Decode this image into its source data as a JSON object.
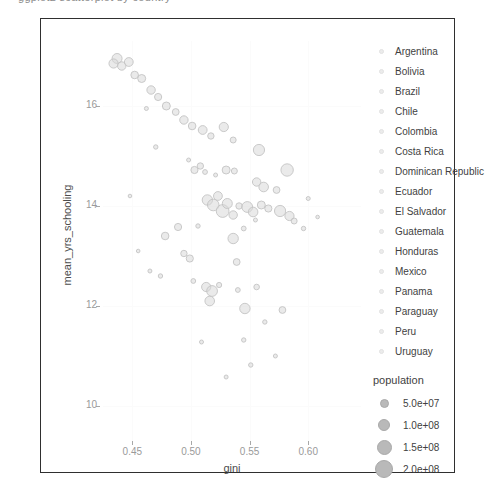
{
  "top_fragment": "ggplot2 scatterplot by country",
  "chart_data": {
    "type": "scatter",
    "title": "",
    "xlabel": "gini",
    "ylabel": "mean_yrs_schooling",
    "xlim": [
      0.425,
      0.645
    ],
    "ylim": [
      9.3,
      17.3
    ],
    "xticks": [
      "0.45",
      "0.50",
      "0.55",
      "0.60"
    ],
    "xtick_values": [
      0.45,
      0.5,
      0.55,
      0.6
    ],
    "yticks": [
      "10",
      "12",
      "14",
      "16"
    ],
    "ytick_values": [
      10,
      12,
      14,
      16
    ],
    "grid": true,
    "legend_position": "right",
    "size_encoding": "population",
    "color_encoding": "country",
    "point_color": "#d8d8d8",
    "point_stroke": "#c4c4c4",
    "points": [
      {
        "x": 0.437,
        "y": 16.95,
        "r": 5.0
      },
      {
        "x": 0.434,
        "y": 16.85,
        "r": 4.6
      },
      {
        "x": 0.441,
        "y": 16.8,
        "r": 4.2
      },
      {
        "x": 0.447,
        "y": 16.88,
        "r": 4.4
      },
      {
        "x": 0.452,
        "y": 16.62,
        "r": 3.8
      },
      {
        "x": 0.458,
        "y": 16.55,
        "r": 4.0
      },
      {
        "x": 0.466,
        "y": 16.32,
        "r": 4.2
      },
      {
        "x": 0.472,
        "y": 16.18,
        "r": 3.6
      },
      {
        "x": 0.479,
        "y": 16.0,
        "r": 4.0
      },
      {
        "x": 0.487,
        "y": 15.88,
        "r": 3.4
      },
      {
        "x": 0.494,
        "y": 15.72,
        "r": 4.2
      },
      {
        "x": 0.501,
        "y": 15.6,
        "r": 3.8
      },
      {
        "x": 0.51,
        "y": 15.52,
        "r": 4.4
      },
      {
        "x": 0.517,
        "y": 15.4,
        "r": 3.2
      },
      {
        "x": 0.528,
        "y": 15.58,
        "r": 4.6
      },
      {
        "x": 0.536,
        "y": 15.32,
        "r": 3.0
      },
      {
        "x": 0.462,
        "y": 15.95,
        "r": 2.0
      },
      {
        "x": 0.47,
        "y": 15.18,
        "r": 2.2
      },
      {
        "x": 0.498,
        "y": 14.92,
        "r": 2.0
      },
      {
        "x": 0.503,
        "y": 14.72,
        "r": 3.6
      },
      {
        "x": 0.508,
        "y": 14.8,
        "r": 3.2
      },
      {
        "x": 0.512,
        "y": 14.68,
        "r": 2.4
      },
      {
        "x": 0.521,
        "y": 14.62,
        "r": 2.0
      },
      {
        "x": 0.53,
        "y": 14.72,
        "r": 4.0
      },
      {
        "x": 0.537,
        "y": 14.7,
        "r": 3.0
      },
      {
        "x": 0.558,
        "y": 15.12,
        "r": 5.6
      },
      {
        "x": 0.556,
        "y": 14.48,
        "r": 4.2
      },
      {
        "x": 0.562,
        "y": 14.38,
        "r": 4.8
      },
      {
        "x": 0.573,
        "y": 14.32,
        "r": 3.4
      },
      {
        "x": 0.582,
        "y": 14.72,
        "r": 6.2
      },
      {
        "x": 0.514,
        "y": 14.12,
        "r": 5.2
      },
      {
        "x": 0.519,
        "y": 14.02,
        "r": 5.8
      },
      {
        "x": 0.523,
        "y": 14.2,
        "r": 4.4
      },
      {
        "x": 0.527,
        "y": 13.9,
        "r": 6.4
      },
      {
        "x": 0.531,
        "y": 14.05,
        "r": 5.0
      },
      {
        "x": 0.536,
        "y": 13.82,
        "r": 4.2
      },
      {
        "x": 0.541,
        "y": 14.0,
        "r": 3.2
      },
      {
        "x": 0.548,
        "y": 13.98,
        "r": 5.4
      },
      {
        "x": 0.553,
        "y": 13.88,
        "r": 4.8
      },
      {
        "x": 0.56,
        "y": 14.02,
        "r": 4.0
      },
      {
        "x": 0.566,
        "y": 13.95,
        "r": 3.6
      },
      {
        "x": 0.576,
        "y": 13.9,
        "r": 5.6
      },
      {
        "x": 0.584,
        "y": 13.8,
        "r": 4.6
      },
      {
        "x": 0.588,
        "y": 13.7,
        "r": 3.0
      },
      {
        "x": 0.506,
        "y": 13.6,
        "r": 2.2
      },
      {
        "x": 0.545,
        "y": 13.55,
        "r": 2.4
      },
      {
        "x": 0.555,
        "y": 13.72,
        "r": 2.0
      },
      {
        "x": 0.489,
        "y": 13.58,
        "r": 3.6
      },
      {
        "x": 0.478,
        "y": 13.4,
        "r": 3.8
      },
      {
        "x": 0.536,
        "y": 13.35,
        "r": 5.2
      },
      {
        "x": 0.596,
        "y": 13.55,
        "r": 2.2
      },
      {
        "x": 0.494,
        "y": 13.05,
        "r": 3.2
      },
      {
        "x": 0.499,
        "y": 12.95,
        "r": 3.6
      },
      {
        "x": 0.539,
        "y": 12.88,
        "r": 3.4
      },
      {
        "x": 0.465,
        "y": 12.7,
        "r": 2.0
      },
      {
        "x": 0.474,
        "y": 12.6,
        "r": 2.2
      },
      {
        "x": 0.502,
        "y": 12.5,
        "r": 2.4
      },
      {
        "x": 0.513,
        "y": 12.38,
        "r": 4.6
      },
      {
        "x": 0.518,
        "y": 12.3,
        "r": 5.4
      },
      {
        "x": 0.524,
        "y": 12.42,
        "r": 2.6
      },
      {
        "x": 0.516,
        "y": 12.1,
        "r": 4.8
      },
      {
        "x": 0.54,
        "y": 12.32,
        "r": 2.4
      },
      {
        "x": 0.556,
        "y": 12.38,
        "r": 2.8
      },
      {
        "x": 0.546,
        "y": 11.95,
        "r": 5.2
      },
      {
        "x": 0.578,
        "y": 11.92,
        "r": 3.4
      },
      {
        "x": 0.563,
        "y": 11.68,
        "r": 2.2
      },
      {
        "x": 0.545,
        "y": 11.32,
        "r": 2.2
      },
      {
        "x": 0.509,
        "y": 11.28,
        "r": 2.0
      },
      {
        "x": 0.572,
        "y": 11.0,
        "r": 2.0
      },
      {
        "x": 0.551,
        "y": 10.82,
        "r": 2.2
      },
      {
        "x": 0.53,
        "y": 10.58,
        "r": 2.0
      },
      {
        "x": 0.448,
        "y": 14.2,
        "r": 1.8
      },
      {
        "x": 0.455,
        "y": 13.1,
        "r": 1.8
      },
      {
        "x": 0.6,
        "y": 14.15,
        "r": 2.0
      },
      {
        "x": 0.608,
        "y": 13.78,
        "r": 1.8
      }
    ]
  },
  "country_legend": {
    "items": [
      "Argentina",
      "Bolivia",
      "Brazil",
      "Chile",
      "Colombia",
      "Costa Rica",
      "Dominican Republic",
      "Ecuador",
      "El Salvador",
      "Guatemala",
      "Honduras",
      "Mexico",
      "Panama",
      "Paraguay",
      "Peru",
      "Uruguay"
    ]
  },
  "population_legend": {
    "title": "population",
    "items": [
      {
        "label": "5.0e+07",
        "size": 9
      },
      {
        "label": "1.0e+08",
        "size": 12
      },
      {
        "label": "1.5e+08",
        "size": 15
      },
      {
        "label": "2.0e+08",
        "size": 18
      }
    ]
  }
}
